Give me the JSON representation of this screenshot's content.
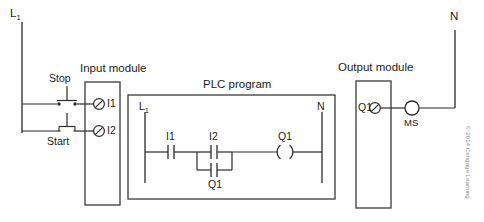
{
  "diagram": {
    "title_hidden": "PLC motor start/stop control wiring and ladder program",
    "rails": {
      "line_label": "L",
      "line_sub": "1",
      "neutral_label": "N"
    },
    "field_devices": {
      "stop_label": "Stop",
      "start_label": "Start"
    },
    "input_module": {
      "title": "Input module",
      "terminals": [
        {
          "label": "I1"
        },
        {
          "label": "I2"
        }
      ]
    },
    "plc_program": {
      "title": "PLC program",
      "left_rail_label": "L",
      "left_rail_sub": "1",
      "right_rail_label": "N",
      "contacts": [
        {
          "label": "I1",
          "type": "normally-open"
        },
        {
          "label": "I2",
          "type": "normally-open"
        },
        {
          "label": "Q1",
          "type": "normally-open-seal-in"
        }
      ],
      "coil": {
        "label": "Q1",
        "type": "output-coil"
      }
    },
    "output_module": {
      "title": "Output module",
      "terminals": [
        {
          "label": "Q1"
        }
      ]
    },
    "load": {
      "label": "MS",
      "type": "motor-starter-coil"
    },
    "credit": "© 2014 Cengage Learning",
    "colors": {
      "wire": "#2b2b2b",
      "box": "#3a3a3a",
      "text": "#1b1b1b",
      "credit": "#8a8a8a",
      "background": "#ffffff"
    }
  }
}
